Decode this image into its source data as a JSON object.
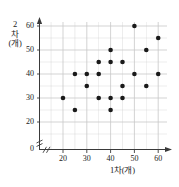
{
  "figure": {
    "background_color": "#ffffff",
    "axis_color": "#3a3a3a",
    "grid_color": "#c8c8c8",
    "point_color": "#1a1a1a"
  },
  "chart_data": {
    "type": "scatter",
    "title": "",
    "xlabel": "1차(개)",
    "ylabel_lines": [
      "2",
      "차",
      "(개)"
    ],
    "ylabel": "2차(개)",
    "xlim": [
      0,
      65
    ],
    "ylim": [
      0,
      65
    ],
    "grid": true,
    "legend": null,
    "axis_break_x": true,
    "axis_break_y": true,
    "origin_label": "0",
    "xticks": [
      20,
      30,
      40,
      50,
      60
    ],
    "xtick_labels": [
      "20",
      "30",
      "40",
      "50",
      "60"
    ],
    "yticks": [
      20,
      30,
      40,
      50,
      60
    ],
    "ytick_labels": [
      "20",
      "30",
      "40",
      "50",
      "60"
    ],
    "points": [
      {
        "x": 20,
        "y": 30
      },
      {
        "x": 25,
        "y": 40
      },
      {
        "x": 25,
        "y": 25
      },
      {
        "x": 30,
        "y": 40
      },
      {
        "x": 30,
        "y": 35
      },
      {
        "x": 35,
        "y": 45
      },
      {
        "x": 35,
        "y": 40
      },
      {
        "x": 35,
        "y": 30
      },
      {
        "x": 40,
        "y": 50
      },
      {
        "x": 40,
        "y": 45
      },
      {
        "x": 40,
        "y": 30
      },
      {
        "x": 40,
        "y": 25
      },
      {
        "x": 45,
        "y": 45
      },
      {
        "x": 45,
        "y": 35
      },
      {
        "x": 45,
        "y": 30
      },
      {
        "x": 50,
        "y": 60
      },
      {
        "x": 50,
        "y": 40
      },
      {
        "x": 55,
        "y": 50
      },
      {
        "x": 55,
        "y": 35
      },
      {
        "x": 60,
        "y": 55
      },
      {
        "x": 60,
        "y": 40
      }
    ],
    "n_points": 21
  }
}
